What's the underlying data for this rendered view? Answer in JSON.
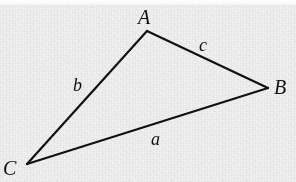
{
  "figure": {
    "width": 296,
    "height": 182,
    "background_color": "#f2f2f2",
    "stroke_color": "#111111",
    "label_color": "#111111"
  },
  "chart_data": {
    "type": "diagram",
    "title": "",
    "subtitle": "",
    "vertices": [
      {
        "name": "A",
        "label": "A",
        "x": 147,
        "y": 31,
        "label_x": 145,
        "label_y": 18
      },
      {
        "name": "B",
        "label": "B",
        "x": 268,
        "y": 88,
        "label_x": 281,
        "label_y": 88
      },
      {
        "name": "C",
        "label": "C",
        "x": 27,
        "y": 164,
        "label_x": 10,
        "label_y": 169
      }
    ],
    "edges": [
      {
        "name": "a",
        "label": "a",
        "from": "C",
        "to": "B",
        "label_x": 158,
        "label_y": 140
      },
      {
        "name": "b",
        "label": "b",
        "from": "C",
        "to": "A",
        "label_x": 80,
        "label_y": 86
      },
      {
        "name": "c",
        "label": "c",
        "from": "A",
        "to": "B",
        "label_x": 206,
        "label_y": 46
      }
    ],
    "stroke_width": 2,
    "grid": false,
    "legend": false,
    "xlabel": "",
    "ylabel": ""
  },
  "labels": {
    "vertex_a": "A",
    "vertex_b": "B",
    "vertex_c": "C",
    "side_a": "a",
    "side_b": "b",
    "side_c": "c"
  }
}
